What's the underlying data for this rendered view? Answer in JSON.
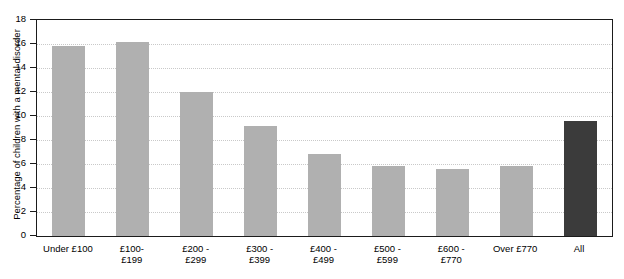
{
  "chart_data": {
    "type": "bar",
    "title": "",
    "xlabel": "",
    "ylabel": "Percentage of children with a mental disorder",
    "ylim": [
      0,
      18
    ],
    "ytick_step": 2,
    "yticks": [
      "0",
      "2",
      "4",
      "6",
      "8",
      "10",
      "12",
      "14",
      "16",
      "18"
    ],
    "grid": true,
    "legend": "none",
    "categories": [
      "Under £100",
      "£100-\n£199",
      "£200 -\n£299",
      "£300 -\n£399",
      "£400 -\n£499",
      "£500 -\n£599",
      "£600 -\n£770",
      "Over £770",
      "All"
    ],
    "values": [
      15.8,
      16.2,
      12.0,
      9.2,
      6.8,
      5.8,
      5.6,
      5.8,
      9.6
    ],
    "colors": {
      "bar": "#b0b0b0",
      "bar_highlight": "#3b3b3b",
      "frame": "#1b1b1b",
      "grid": "#c9c9c9",
      "background": "#ffffff",
      "text": "#000000"
    },
    "bars": [
      {
        "label_line1": "Under £100",
        "label_line2": "",
        "value": 15.8,
        "highlight": false
      },
      {
        "label_line1": "£100-",
        "label_line2": "£199",
        "value": 16.2,
        "highlight": false
      },
      {
        "label_line1": "£200 -",
        "label_line2": "£299",
        "value": 12.0,
        "highlight": false
      },
      {
        "label_line1": "£300 -",
        "label_line2": "£399",
        "value": 9.2,
        "highlight": false
      },
      {
        "label_line1": "£400 -",
        "label_line2": "£499",
        "value": 6.8,
        "highlight": false
      },
      {
        "label_line1": "£500 -",
        "label_line2": "£599",
        "value": 5.8,
        "highlight": false
      },
      {
        "label_line1": "£600 -",
        "label_line2": "£770",
        "value": 5.6,
        "highlight": false
      },
      {
        "label_line1": "Over £770",
        "label_line2": "",
        "value": 5.8,
        "highlight": false
      },
      {
        "label_line1": "All",
        "label_line2": "",
        "value": 9.6,
        "highlight": true
      }
    ]
  }
}
